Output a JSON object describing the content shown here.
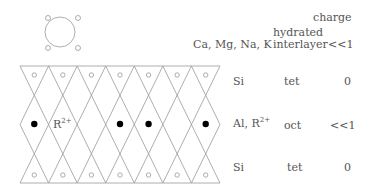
{
  "legend": {
    "cation_label": "Ca, Mg, Na, K",
    "layer_label_line1": "hydrated",
    "layer_label_line2": "interlayer",
    "charge_header": "charge",
    "interlayer_charge": "<<1"
  },
  "rows": [
    {
      "cation": "Si",
      "site": "tet",
      "charge": "0"
    },
    {
      "cation": "Al, R",
      "cation_sup": "2+",
      "site": "oct",
      "charge": "<<1"
    },
    {
      "cation": "Si",
      "site": "tet",
      "charge": "0"
    }
  ],
  "lattice_label": {
    "base": "R",
    "sup": "2+"
  },
  "colors": {
    "line": "#999999",
    "text": "#555555",
    "dot": "#000000"
  }
}
